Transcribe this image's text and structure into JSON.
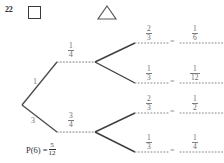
{
  "question": {
    "number": "22",
    "answer_box_label": "answer-box",
    "marker_shape_label": "triangle-marker"
  },
  "tree": {
    "stage1": {
      "upper_label": "1",
      "lower_label": "3"
    },
    "stage2": {
      "upper": {
        "numerator": "1",
        "denominator": "4"
      },
      "lower": {
        "numerator": "3",
        "denominator": "4"
      }
    },
    "branches": [
      {
        "probability": {
          "numerator": "2",
          "denominator": "3"
        },
        "equals": "=",
        "outcome": {
          "numerator": "1",
          "denominator": "6"
        }
      },
      {
        "probability": {
          "numerator": "1",
          "denominator": "3"
        },
        "equals": "=",
        "outcome": {
          "numerator": "1",
          "denominator": "12"
        }
      },
      {
        "probability": {
          "numerator": "2",
          "denominator": "3"
        },
        "equals": "=",
        "outcome": {
          "numerator": "1",
          "denominator": "2"
        }
      },
      {
        "probability": {
          "numerator": "1",
          "denominator": "3"
        },
        "equals": "=",
        "outcome": {
          "numerator": "1",
          "denominator": "4"
        }
      }
    ]
  },
  "answer": {
    "prefix": "P(6) =",
    "value": {
      "numerator": "5",
      "denominator": "12"
    }
  },
  "colors": {
    "ink": "#4a4a4a",
    "pencil": "#7d7d7d",
    "bold_ink": "#2b2b2b",
    "paper": "#ffffff"
  }
}
